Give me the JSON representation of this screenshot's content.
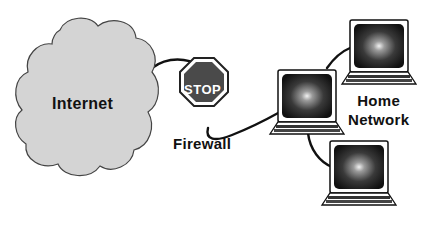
{
  "diagram": {
    "internet": {
      "label": "Internet",
      "shape": "cloud",
      "fill": "#d4d4d4"
    },
    "firewall": {
      "sign_text": "STOP",
      "label": "Firewall",
      "sign_fill": "#4a4a4a"
    },
    "home_network": {
      "label_line1": "Home",
      "label_line2": "Network",
      "computers": [
        {
          "name": "laptop-top-right"
        },
        {
          "name": "laptop-middle"
        },
        {
          "name": "laptop-bottom"
        }
      ]
    },
    "connections": [
      {
        "from": "internet",
        "to": "firewall"
      },
      {
        "from": "firewall",
        "to": "laptop-middle"
      },
      {
        "from": "laptop-middle",
        "to": "laptop-top-right"
      },
      {
        "from": "laptop-middle",
        "to": "laptop-bottom"
      }
    ]
  }
}
